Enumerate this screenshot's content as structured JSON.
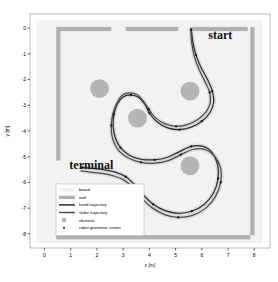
{
  "chart_data": {
    "type": "line",
    "title": "",
    "xlabel": "x [m]",
    "ylabel": "y [m]",
    "xlim": [
      -0.55,
      8.6
    ],
    "ylim": [
      -8.55,
      0.55
    ],
    "xticks": [
      "0",
      "1",
      "2",
      "3",
      "4",
      "5",
      "6",
      "7",
      "8"
    ],
    "xtick_values": [
      0,
      1,
      2,
      3,
      4,
      5,
      6,
      7,
      8
    ],
    "yticks": [
      "0",
      "-1",
      "-2",
      "-3",
      "-4",
      "-5",
      "-6",
      "-7",
      "-8"
    ],
    "ytick_values": [
      0,
      -1,
      -2,
      -3,
      -4,
      -5,
      -6,
      -7,
      -8
    ],
    "grid": false,
    "legend_position": "lower-left",
    "board": {
      "label": "board",
      "color": "#f2f2f2",
      "x_range": [
        -0.3,
        8.3
      ],
      "y_range": [
        -8.35,
        0.3
      ]
    },
    "walls": {
      "label": "wall",
      "color": "#b0b0b0",
      "segments": [
        {
          "name": "top-left",
          "x0": 0.55,
          "y0": 0.05,
          "x1": 2.55,
          "y1": 0.05
        },
        {
          "name": "top-mid",
          "x0": 3.1,
          "y0": 0.05,
          "x1": 5.1,
          "y1": 0.05
        },
        {
          "name": "top-right",
          "x0": 5.55,
          "y0": 0.05,
          "x1": 7.75,
          "y1": 0.05
        },
        {
          "name": "left-upper",
          "x0": 0.45,
          "y0": 0.05,
          "x1": 0.45,
          "y1": -5.15
        },
        {
          "name": "left-lower",
          "x0": 0.45,
          "y0": -6.05,
          "x1": 0.45,
          "y1": -8.05
        },
        {
          "name": "right",
          "x0": 7.85,
          "y0": 0.05,
          "x1": 7.85,
          "y1": -8.05
        },
        {
          "name": "bottom",
          "x0": 0.45,
          "y0": -8.05,
          "x1": 7.85,
          "y1": -8.05
        }
      ]
    },
    "obstacles": {
      "label": "obstacle",
      "color": "#b5b5b5",
      "radius": 0.36,
      "points": [
        {
          "x": 2.1,
          "y": -2.35
        },
        {
          "x": 3.55,
          "y": -3.5
        },
        {
          "x": 5.55,
          "y": -2.45
        },
        {
          "x": 5.55,
          "y": -5.35
        }
      ]
    },
    "series": [
      {
        "name": "hand trajectory",
        "color": "#2a2a2a",
        "width": 1.25,
        "points": [
          {
            "x": 5.6,
            "y": -0.05
          },
          {
            "x": 5.66,
            "y": -0.55
          },
          {
            "x": 5.78,
            "y": -1.05
          },
          {
            "x": 5.98,
            "y": -1.55
          },
          {
            "x": 6.22,
            "y": -2.0
          },
          {
            "x": 6.4,
            "y": -2.45
          },
          {
            "x": 6.45,
            "y": -2.9
          },
          {
            "x": 6.3,
            "y": -3.3
          },
          {
            "x": 6.0,
            "y": -3.62
          },
          {
            "x": 5.6,
            "y": -3.85
          },
          {
            "x": 5.15,
            "y": -3.95
          },
          {
            "x": 4.7,
            "y": -3.88
          },
          {
            "x": 4.3,
            "y": -3.65
          },
          {
            "x": 4.0,
            "y": -3.3
          },
          {
            "x": 3.82,
            "y": -2.95
          },
          {
            "x": 3.6,
            "y": -2.7
          },
          {
            "x": 3.3,
            "y": -2.6
          },
          {
            "x": 3.0,
            "y": -2.68
          },
          {
            "x": 2.78,
            "y": -2.95
          },
          {
            "x": 2.65,
            "y": -3.35
          },
          {
            "x": 2.62,
            "y": -3.8
          },
          {
            "x": 2.7,
            "y": -4.25
          },
          {
            "x": 2.9,
            "y": -4.65
          },
          {
            "x": 3.25,
            "y": -4.95
          },
          {
            "x": 3.7,
            "y": -5.1
          },
          {
            "x": 4.2,
            "y": -5.12
          },
          {
            "x": 4.7,
            "y": -5.02
          },
          {
            "x": 5.15,
            "y": -4.8
          },
          {
            "x": 5.6,
            "y": -4.6
          },
          {
            "x": 6.05,
            "y": -4.6
          },
          {
            "x": 6.4,
            "y": -4.85
          },
          {
            "x": 6.6,
            "y": -5.3
          },
          {
            "x": 6.62,
            "y": -5.85
          },
          {
            "x": 6.45,
            "y": -6.4
          },
          {
            "x": 6.1,
            "y": -6.85
          },
          {
            "x": 5.62,
            "y": -7.12
          },
          {
            "x": 5.1,
            "y": -7.2
          },
          {
            "x": 4.6,
            "y": -7.1
          },
          {
            "x": 4.15,
            "y": -6.85
          },
          {
            "x": 3.78,
            "y": -6.5
          },
          {
            "x": 3.45,
            "y": -6.1
          },
          {
            "x": 3.1,
            "y": -5.78
          },
          {
            "x": 2.7,
            "y": -5.6
          },
          {
            "x": 2.25,
            "y": -5.5
          },
          {
            "x": 1.8,
            "y": -5.45
          },
          {
            "x": 1.45,
            "y": -5.42
          }
        ],
        "markers": [
          {
            "x": 5.6,
            "y": -0.05
          },
          {
            "x": 5.78,
            "y": -1.05
          },
          {
            "x": 6.4,
            "y": -2.45
          },
          {
            "x": 6.0,
            "y": -3.62
          },
          {
            "x": 5.15,
            "y": -3.95
          },
          {
            "x": 4.0,
            "y": -3.3
          },
          {
            "x": 3.3,
            "y": -2.6
          },
          {
            "x": 2.65,
            "y": -3.35
          },
          {
            "x": 2.9,
            "y": -4.65
          },
          {
            "x": 4.2,
            "y": -5.12
          },
          {
            "x": 5.6,
            "y": -4.6
          },
          {
            "x": 6.62,
            "y": -5.85
          },
          {
            "x": 5.62,
            "y": -7.12
          },
          {
            "x": 4.15,
            "y": -6.85
          },
          {
            "x": 3.1,
            "y": -5.78
          },
          {
            "x": 1.45,
            "y": -5.42
          }
        ]
      },
      {
        "name": "slider trajectory",
        "color": "#4a4a4a",
        "width": 1.25,
        "points": [
          {
            "x": 5.58,
            "y": -0.05
          },
          {
            "x": 5.62,
            "y": -0.6
          },
          {
            "x": 5.72,
            "y": -1.12
          },
          {
            "x": 5.9,
            "y": -1.62
          },
          {
            "x": 6.12,
            "y": -2.08
          },
          {
            "x": 6.3,
            "y": -2.5
          },
          {
            "x": 6.32,
            "y": -2.92
          },
          {
            "x": 6.15,
            "y": -3.28
          },
          {
            "x": 5.85,
            "y": -3.55
          },
          {
            "x": 5.45,
            "y": -3.75
          },
          {
            "x": 5.02,
            "y": -3.82
          },
          {
            "x": 4.6,
            "y": -3.72
          },
          {
            "x": 4.25,
            "y": -3.5
          },
          {
            "x": 3.98,
            "y": -3.15
          },
          {
            "x": 3.78,
            "y": -2.85
          },
          {
            "x": 3.55,
            "y": -2.6
          },
          {
            "x": 3.25,
            "y": -2.52
          },
          {
            "x": 2.98,
            "y": -2.6
          },
          {
            "x": 2.78,
            "y": -2.88
          },
          {
            "x": 2.62,
            "y": -3.3
          },
          {
            "x": 2.55,
            "y": -3.78
          },
          {
            "x": 2.6,
            "y": -4.3
          },
          {
            "x": 2.82,
            "y": -4.75
          },
          {
            "x": 3.2,
            "y": -5.05
          },
          {
            "x": 3.68,
            "y": -5.22
          },
          {
            "x": 4.2,
            "y": -5.25
          },
          {
            "x": 4.72,
            "y": -5.15
          },
          {
            "x": 5.2,
            "y": -4.92
          },
          {
            "x": 5.65,
            "y": -4.72
          },
          {
            "x": 6.12,
            "y": -4.72
          },
          {
            "x": 6.5,
            "y": -5.0
          },
          {
            "x": 6.72,
            "y": -5.45
          },
          {
            "x": 6.72,
            "y": -6.0
          },
          {
            "x": 6.52,
            "y": -6.55
          },
          {
            "x": 6.15,
            "y": -7.0
          },
          {
            "x": 5.65,
            "y": -7.28
          },
          {
            "x": 5.1,
            "y": -7.36
          },
          {
            "x": 4.58,
            "y": -7.25
          },
          {
            "x": 4.1,
            "y": -6.98
          },
          {
            "x": 3.72,
            "y": -6.62
          },
          {
            "x": 3.4,
            "y": -6.22
          },
          {
            "x": 3.05,
            "y": -5.92
          },
          {
            "x": 2.65,
            "y": -5.75
          },
          {
            "x": 2.2,
            "y": -5.65
          },
          {
            "x": 1.75,
            "y": -5.6
          },
          {
            "x": 1.4,
            "y": -5.55
          }
        ],
        "markers": [
          {
            "x": 6.3,
            "y": -2.5
          },
          {
            "x": 5.02,
            "y": -3.82
          },
          {
            "x": 3.98,
            "y": -3.15
          },
          {
            "x": 2.55,
            "y": -3.78
          },
          {
            "x": 3.68,
            "y": -5.22
          },
          {
            "x": 5.2,
            "y": -4.92
          },
          {
            "x": 6.72,
            "y": -6.0
          },
          {
            "x": 5.1,
            "y": -7.36
          },
          {
            "x": 3.4,
            "y": -6.22
          }
        ]
      }
    ],
    "annotations": [
      {
        "text": "start",
        "x": 6.25,
        "y": -0.42
      },
      {
        "text": "terminal",
        "x": 0.95,
        "y": -5.48
      }
    ],
    "legend_entries": [
      {
        "label": "board",
        "type": "patch",
        "color": "#f0f0f0"
      },
      {
        "label": "wall",
        "type": "patch",
        "color": "#b0b0b0"
      },
      {
        "label": "hand trajectory",
        "type": "line",
        "color": "#2a2a2a"
      },
      {
        "label": "slider trajectory",
        "type": "line",
        "color": "#4a4a4a"
      },
      {
        "label": "obstacle",
        "type": "circle",
        "color": "#b5b5b5"
      },
      {
        "label": "robot geometric center",
        "type": "dot",
        "color": "#111111"
      }
    ]
  }
}
